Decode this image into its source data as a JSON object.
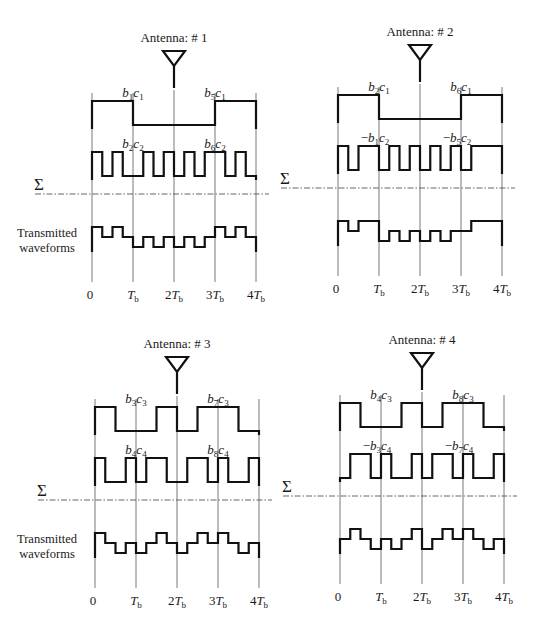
{
  "figure": {
    "sum_symbol": "Σ",
    "side_label": [
      "Transmitted",
      "waveforms"
    ],
    "time_ticks": [
      "0",
      "T_b",
      "2T_b",
      "3T_b",
      "4T_b"
    ],
    "chips_per_period": 16,
    "panels": [
      {
        "id": "antenna-1",
        "title": "Antenna: # 1",
        "origin": {
          "x": 92,
          "y": 0
        },
        "show_side_label": true,
        "rows": [
          {
            "labels": [
              {
                "text": "b1c1",
                "base": "b",
                "s1": "1",
                "mid": "c",
                "s2": "1",
                "neg": false,
                "tick": 1
              },
              {
                "text": "b5c1",
                "base": "b",
                "s1": "5",
                "mid": "c",
                "s2": "1",
                "neg": false,
                "tick": 3
              }
            ],
            "chips": [
              1,
              1,
              1,
              1,
              0,
              0,
              0,
              0,
              0,
              0,
              0,
              0,
              1,
              1,
              1,
              1
            ]
          },
          {
            "labels": [
              {
                "text": "b2c2",
                "base": "b",
                "s1": "2",
                "mid": "c",
                "s2": "2",
                "neg": false,
                "tick": 1
              },
              {
                "text": "b6c2",
                "base": "b",
                "s1": "6",
                "mid": "c",
                "s2": "2",
                "neg": false,
                "tick": 3
              }
            ],
            "chips": [
              1,
              0,
              1,
              0,
              0,
              1,
              0,
              1,
              0,
              1,
              0,
              1,
              1,
              0,
              1,
              0
            ]
          }
        ]
      },
      {
        "id": "antenna-2",
        "title": "Antenna: # 2",
        "origin": {
          "x": 338,
          "y": -6
        },
        "show_side_label": false,
        "rows": [
          {
            "labels": [
              {
                "text": "b2c1",
                "base": "b",
                "s1": "2",
                "mid": "c",
                "s2": "1",
                "neg": false,
                "tick": 1
              },
              {
                "text": "b6c1",
                "base": "b",
                "s1": "6",
                "mid": "c",
                "s2": "1",
                "neg": false,
                "tick": 3
              }
            ],
            "chips": [
              1,
              1,
              1,
              1,
              0,
              0,
              0,
              0,
              0,
              0,
              0,
              0,
              1,
              1,
              1,
              1
            ]
          },
          {
            "labels": [
              {
                "text": "-b1c2",
                "base": "b",
                "s1": "1",
                "mid": "c",
                "s2": "2",
                "neg": true,
                "tick": 1
              },
              {
                "text": "-b5c2",
                "base": "b",
                "s1": "5",
                "mid": "c",
                "s2": "2",
                "neg": true,
                "tick": 3
              }
            ],
            "chips": [
              1,
              0,
              1,
              1,
              0,
              1,
              0,
              1,
              0,
              1,
              0,
              1,
              0,
              1,
              1,
              1
            ]
          }
        ]
      },
      {
        "id": "antenna-3",
        "title": "Antenna: # 3",
        "origin": {
          "x": 95,
          "y": 306
        },
        "show_side_label": true,
        "rows": [
          {
            "labels": [
              {
                "text": "b3c3",
                "base": "b",
                "s1": "3",
                "mid": "c",
                "s2": "3",
                "neg": false,
                "tick": 1
              },
              {
                "text": "b7c3",
                "base": "b",
                "s1": "7",
                "mid": "c",
                "s2": "3",
                "neg": false,
                "tick": 3
              }
            ],
            "chips": [
              1,
              1,
              0,
              0,
              0,
              0,
              1,
              1,
              0,
              0,
              1,
              1,
              1,
              1,
              0,
              0
            ]
          },
          {
            "labels": [
              {
                "text": "b4c4",
                "base": "b",
                "s1": "4",
                "mid": "c",
                "s2": "4",
                "neg": false,
                "tick": 1
              },
              {
                "text": "b8c4",
                "base": "b",
                "s1": "8",
                "mid": "c",
                "s2": "4",
                "neg": false,
                "tick": 3
              }
            ],
            "chips": [
              1,
              0,
              0,
              1,
              0,
              1,
              1,
              0,
              0,
              1,
              1,
              0,
              1,
              0,
              0,
              1
            ]
          }
        ]
      },
      {
        "id": "antenna-4",
        "title": "Antenna: # 4",
        "origin": {
          "x": 340,
          "y": 302
        },
        "show_side_label": false,
        "rows": [
          {
            "labels": [
              {
                "text": "b4c3",
                "base": "b",
                "s1": "4",
                "mid": "c",
                "s2": "3",
                "neg": false,
                "tick": 1
              },
              {
                "text": "b8c3",
                "base": "b",
                "s1": "8",
                "mid": "c",
                "s2": "3",
                "neg": false,
                "tick": 3
              }
            ],
            "chips": [
              1,
              1,
              0,
              0,
              0,
              0,
              1,
              1,
              0,
              0,
              1,
              1,
              1,
              1,
              0,
              0
            ]
          },
          {
            "labels": [
              {
                "text": "-b3c4",
                "base": "b",
                "s1": "3",
                "mid": "c",
                "s2": "4",
                "neg": true,
                "tick": 1
              },
              {
                "text": "-b7c4",
                "base": "b",
                "s1": "7",
                "mid": "c",
                "s2": "4",
                "neg": true,
                "tick": 3
              }
            ],
            "chips": [
              0,
              1,
              1,
              0,
              1,
              0,
              0,
              1,
              0,
              1,
              1,
              0,
              1,
              0,
              0,
              1
            ]
          }
        ]
      }
    ]
  }
}
